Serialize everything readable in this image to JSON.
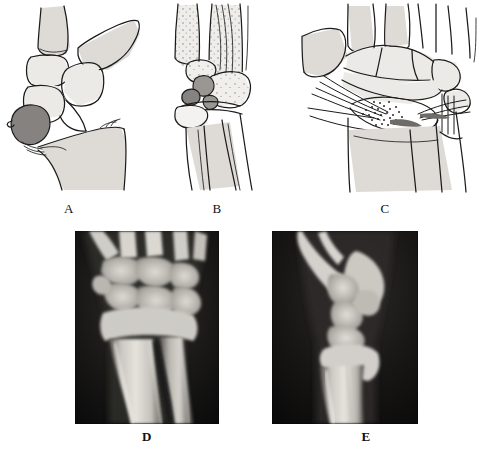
{
  "figure": {
    "kind": "medical-figure",
    "background_color": "#ffffff",
    "ink_color": "#1b1b1b",
    "bone_fill_color": "#eceae7",
    "fragment_color": "#85827f",
    "xray_background_color": "#0b0b0b",
    "xray_bone_color": "#d8d6d1"
  },
  "panels": [
    {
      "id": "A",
      "label": "A",
      "type": "line-drawing",
      "view": "lateral",
      "content": "Lateral schematic of the wrist showing a displaced volar rim fragment of the distal radius shaded dark grey, with the carpus subluxated volarly",
      "has_shaded_fragment": true,
      "fragment_count": 1,
      "label_x": 69,
      "label_y": 203
    },
    {
      "id": "B",
      "label": "B",
      "type": "line-drawing",
      "view": "posteroanterior",
      "content": "Posteroanterior schematic of the wrist with stippled metacarpals and carpal bones; two small dark grey comminuted fragments lie at the ulnar side of the distal radius",
      "has_shaded_fragment": true,
      "fragment_count": 2,
      "label_x": 217,
      "label_y": 203
    },
    {
      "id": "C",
      "label": "C",
      "type": "line-drawing",
      "view": "posteroanterior",
      "content": "Posteroanterior schematic of the wrist after open reduction, showing Kirschner wires entering from radial and ulnar sides and stippled cancellous bone graft packed into the metaphyseal defect",
      "has_shaded_fragment": false,
      "has_k_wires": true,
      "k_wire_count": 2,
      "has_bone_graft": true,
      "label_x": 385,
      "label_y": 203
    },
    {
      "id": "D",
      "label": "D",
      "type": "radiograph",
      "view": "posteroanterior",
      "content": "Posteroanterior radiograph of the wrist and distal forearm showing the distal radius and ulna with the carpal rows",
      "frame_x": 75,
      "frame_y": 231,
      "frame_width": 144,
      "frame_height": 193,
      "label_x": 143,
      "label_y": 436
    },
    {
      "id": "E",
      "label": "E",
      "type": "radiograph",
      "view": "lateral",
      "content": "Lateral radiograph of the wrist and distal forearm showing the distal radius, carpus and the overlying soft tissue shadow of the thumb",
      "frame_x": 272,
      "frame_y": 231,
      "frame_width": 146,
      "frame_height": 193,
      "label_x": 362,
      "label_y": 436
    }
  ],
  "captions": {
    "a": "A",
    "b": "B",
    "c": "C",
    "d": "D",
    "e": "E"
  }
}
